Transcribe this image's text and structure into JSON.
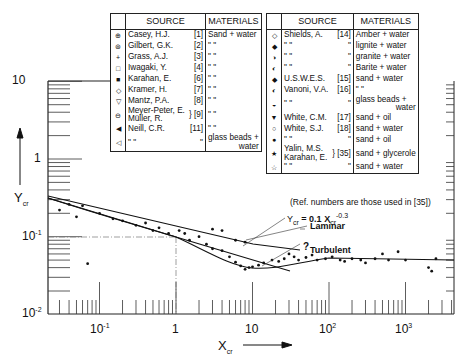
{
  "chart_data": {
    "type": "scatter",
    "title": "",
    "xlabel": "X_cr",
    "ylabel": "Y_cr",
    "xscale": "log",
    "yscale": "log",
    "xlim": [
      0.02,
      4000
    ],
    "ylim": [
      0.01,
      10
    ],
    "x_ticks": [
      "10^-1",
      "1",
      "10",
      "10^2",
      "10^3"
    ],
    "y_ticks": [
      "10^-2",
      "10^-1",
      "1",
      "10"
    ],
    "grid": false,
    "legend_position": "top (two boxed tables)",
    "annotations": [
      "Y_cr = 0.1 X_cr^-0.3",
      "Laminar",
      "Turbulent",
      "?",
      "(Ref. numbers are those used in [35])"
    ],
    "series": [
      {
        "name": "Laminar line Y_cr = 0.1 X_cr^-0.3",
        "x": [
          0.02,
          0.1,
          1,
          10,
          30
        ],
        "y": [
          0.32,
          0.2,
          0.1,
          0.05,
          0.036
        ]
      },
      {
        "name": "Turbulent curve",
        "x": [
          0.02,
          0.1,
          1,
          3,
          6,
          10,
          20,
          50,
          100,
          1000,
          3000
        ],
        "y": [
          0.31,
          0.2,
          0.1,
          0.063,
          0.045,
          0.04,
          0.044,
          0.05,
          0.053,
          0.05,
          0.05
        ]
      }
    ]
  },
  "legend_left": {
    "headers": {
      "symbol": "",
      "source": "SOURCE",
      "materials": "MATERIALS"
    },
    "rows": [
      {
        "symbol": "⊕",
        "source": "Casey, H.J.",
        "ref": "[1]",
        "materials": "Sand + water"
      },
      {
        "symbol": "⊛",
        "source": "Gilbert, G.K.",
        "ref": "[2]",
        "materials": "\"      \""
      },
      {
        "symbol": "+",
        "source": "Grass, A.J.",
        "ref": "[3]",
        "materials": "\"      \""
      },
      {
        "symbol": "□",
        "source": "Iwagaki, Y.",
        "ref": "[4]",
        "materials": "\"      \""
      },
      {
        "symbol": "■",
        "source": "Karahan, E.",
        "ref": "[6]",
        "materials": "\"      \""
      },
      {
        "symbol": "◇",
        "source": "Kramer, H.",
        "ref": "[7]",
        "materials": "\"      \""
      },
      {
        "symbol": "▽",
        "source": "Mantz, P.A.",
        "ref": "[8]",
        "materials": "\"      \""
      },
      {
        "symbol": "⊖",
        "source": "Meyer-Peter, E.",
        "source2": "Müller, R.",
        "ref": "} [9]",
        "materials": "\"      \""
      },
      {
        "symbol": "◀",
        "source": "Neill, C.R.",
        "ref": "[11]",
        "materials": "\"      \""
      },
      {
        "symbol": "◁",
        "source": "\"      \"",
        "ref": "\"",
        "materials": "glass beads +",
        "materials2": "water"
      }
    ]
  },
  "legend_right": {
    "headers": {
      "symbol": "",
      "source": "SOURCE",
      "materials": "MATERIALS"
    },
    "rows": [
      {
        "symbol": "◇",
        "source": "Shields, A.",
        "ref": "[14]",
        "materials": "Amber + water"
      },
      {
        "symbol": "◆",
        "source": "\"      \"",
        "ref": "\"",
        "materials": "lignite + water"
      },
      {
        "symbol": "◑",
        "source": "\"      \"",
        "ref": "\"",
        "materials": "granite + water"
      },
      {
        "symbol": "◐",
        "source": "\"      \"",
        "ref": "\"",
        "materials": "Barite + water"
      },
      {
        "symbol": "◆",
        "source": "U.S.W.E.S.",
        "ref": "[15]",
        "materials": "sand + water"
      },
      {
        "symbol": "◐",
        "source": "Vanoni, V.A.",
        "ref": "[16]",
        "materials": "\"      \""
      },
      {
        "symbol": "◒",
        "source": "\"      \"",
        "ref": "\"",
        "materials": "glass beads +",
        "materials2": "water"
      },
      {
        "symbol": "▼",
        "source": "White, C.M.",
        "ref": "[17]",
        "materials": "sand + oil"
      },
      {
        "symbol": "○",
        "source": "White, S.J.",
        "ref": "[18]",
        "materials": "sand + water"
      },
      {
        "symbol": "●",
        "source": "\"      \"",
        "ref": "\"",
        "materials": "sand + oil"
      },
      {
        "symbol": "★",
        "source": "Yalin, M.S.",
        "source2": "Karahan, E.",
        "ref": "} [35]",
        "materials": "sand + glycerole"
      },
      {
        "symbol": "☆",
        "source": "\"      \"",
        "ref": "\"",
        "materials": "sand + water"
      }
    ]
  },
  "note": "(Ref. numbers are those used in [35])",
  "labels": {
    "equation_main": "Y",
    "equation_sub": "cr",
    "equation_eq": " = 0.1 X",
    "equation_sup": "-0.3",
    "equation_sub2": "cr",
    "laminar": "Laminar",
    "turbulent": "Turbulent",
    "question": "?"
  },
  "axes": {
    "y_label_main": "Y",
    "y_label_sub": "cr",
    "x_label_main": "X",
    "x_label_sub": "cr",
    "y_tick_10": "10",
    "y_tick_1": "1",
    "y_tick_01_base": "10",
    "y_tick_01_exp": "-1",
    "y_tick_001_base": "10",
    "y_tick_001_exp": "-2",
    "x_tick_01_base": "10",
    "x_tick_01_exp": "-1",
    "x_tick_1": "1",
    "x_tick_10": "10",
    "x_tick_100_base": "10",
    "x_tick_100_exp": "2",
    "x_tick_1000_base": "10",
    "x_tick_1000_exp": "3"
  }
}
